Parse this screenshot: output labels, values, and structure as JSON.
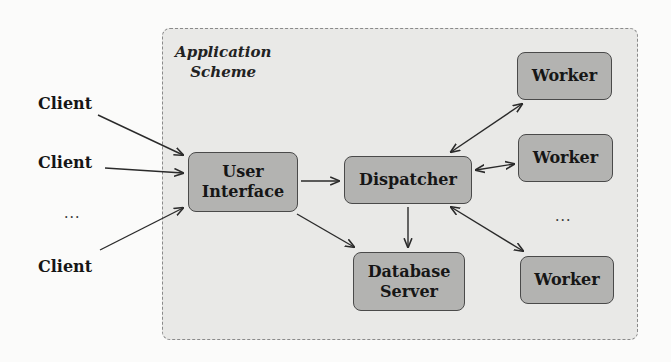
{
  "diagram": {
    "container_label_line1": "Application",
    "container_label_line2": "Scheme",
    "clients": [
      {
        "label": "Client"
      },
      {
        "label": "Client"
      },
      {
        "label": "Client"
      }
    ],
    "clients_ellipsis": "...",
    "nodes": {
      "user_interface": {
        "line1": "User",
        "line2": "Interface"
      },
      "dispatcher": {
        "label": "Dispatcher"
      },
      "database_server": {
        "line1": "Database",
        "line2": "Server"
      },
      "workers": [
        {
          "label": "Worker"
        },
        {
          "label": "Worker"
        },
        {
          "label": "Worker"
        }
      ]
    },
    "workers_ellipsis": "...",
    "edges": [
      {
        "from": "Client 1",
        "to": "User Interface",
        "type": "directed"
      },
      {
        "from": "Client 2",
        "to": "User Interface",
        "type": "directed"
      },
      {
        "from": "Client 3",
        "to": "User Interface",
        "type": "directed"
      },
      {
        "from": "User Interface",
        "to": "Dispatcher",
        "type": "directed"
      },
      {
        "from": "User Interface",
        "to": "Database Server",
        "type": "directed"
      },
      {
        "from": "Dispatcher",
        "to": "Database Server",
        "type": "directed"
      },
      {
        "from": "Dispatcher",
        "to": "Worker 1",
        "type": "bidirectional"
      },
      {
        "from": "Dispatcher",
        "to": "Worker 2",
        "type": "bidirectional"
      },
      {
        "from": "Dispatcher",
        "to": "Worker 3",
        "type": "bidirectional"
      }
    ],
    "colors": {
      "container_fill": "#e9e9e7",
      "container_border": "#8a8a8a",
      "node_fill": "#b3b3b1",
      "node_border": "#4a4a4a",
      "edge": "#2a2a2a"
    }
  }
}
